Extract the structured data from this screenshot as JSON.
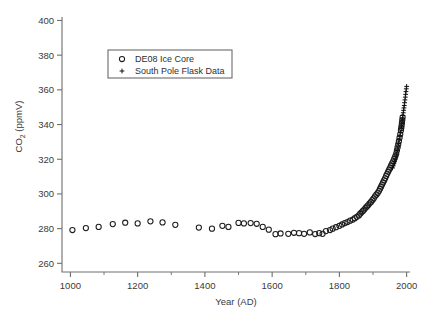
{
  "chart_data": {
    "type": "scatter",
    "title": "",
    "xlabel": "Year (AD)",
    "ylabel": "CO2 (ppmV)",
    "ylabel_base": "CO",
    "ylabel_sub": "2",
    "ylabel_unit": " (ppmV)",
    "xlim": [
      975,
      2010
    ],
    "ylim": [
      255,
      402
    ],
    "xticks": [
      1000,
      1200,
      1400,
      1600,
      1800,
      2000
    ],
    "xticklabels": [
      "1000",
      "1200",
      "1400",
      "1600",
      "1800",
      "2000"
    ],
    "xminorticks": [
      1100,
      1300,
      1500,
      1700,
      1900
    ],
    "yticks": [
      260,
      280,
      300,
      320,
      340,
      360,
      380,
      400
    ],
    "yticklabels": [
      "260",
      "280",
      "300",
      "320",
      "340",
      "360",
      "380",
      "400"
    ],
    "grid": false,
    "legend_position": "upper-left-inset",
    "legend": [
      {
        "label": "DE08 Ice Core",
        "marker": "circle"
      },
      {
        "label": "South Pole Flask Data",
        "marker": "plus"
      }
    ],
    "series": [
      {
        "name": "DE08 Ice Core",
        "marker": "circle",
        "points": [
          [
            1006,
            279.2
          ],
          [
            1046,
            280.3
          ],
          [
            1084,
            281.0
          ],
          [
            1126,
            282.6
          ],
          [
            1163,
            283.4
          ],
          [
            1200,
            283.0
          ],
          [
            1238,
            284.2
          ],
          [
            1274,
            283.6
          ],
          [
            1312,
            282.2
          ],
          [
            1382,
            280.6
          ],
          [
            1421,
            280.0
          ],
          [
            1452,
            281.6
          ],
          [
            1470,
            281.0
          ],
          [
            1500,
            283.3
          ],
          [
            1516,
            283.0
          ],
          [
            1536,
            283.2
          ],
          [
            1554,
            282.8
          ],
          [
            1572,
            281.0
          ],
          [
            1590,
            279.4
          ],
          [
            1610,
            276.8
          ],
          [
            1625,
            277.2
          ],
          [
            1648,
            277.0
          ],
          [
            1665,
            277.6
          ],
          [
            1680,
            277.4
          ],
          [
            1695,
            277.0
          ],
          [
            1712,
            277.8
          ],
          [
            1728,
            276.9
          ],
          [
            1740,
            277.4
          ],
          [
            1750,
            277.0
          ],
          [
            1760,
            278.6
          ],
          [
            1772,
            279.2
          ],
          [
            1780,
            280.0
          ],
          [
            1790,
            280.8
          ],
          [
            1800,
            281.6
          ],
          [
            1808,
            282.4
          ],
          [
            1816,
            283.2
          ],
          [
            1824,
            283.8
          ],
          [
            1832,
            284.6
          ],
          [
            1840,
            285.2
          ],
          [
            1846,
            286.0
          ],
          [
            1852,
            286.8
          ],
          [
            1858,
            287.6
          ],
          [
            1862,
            288.6
          ],
          [
            1866,
            289.4
          ],
          [
            1870,
            290.2
          ],
          [
            1874,
            291.0
          ],
          [
            1878,
            292.0
          ],
          [
            1882,
            292.8
          ],
          [
            1886,
            293.6
          ],
          [
            1890,
            294.6
          ],
          [
            1894,
            295.4
          ],
          [
            1898,
            296.4
          ],
          [
            1902,
            297.4
          ],
          [
            1906,
            298.6
          ],
          [
            1910,
            299.6
          ],
          [
            1914,
            300.6
          ],
          [
            1918,
            301.8
          ],
          [
            1921,
            303.0
          ],
          [
            1924,
            304.2
          ],
          [
            1927,
            305.4
          ],
          [
            1930,
            306.6
          ],
          [
            1933,
            307.8
          ],
          [
            1936,
            309.0
          ],
          [
            1939,
            310.4
          ],
          [
            1942,
            311.6
          ],
          [
            1945,
            312.8
          ],
          [
            1948,
            314.0
          ],
          [
            1951,
            315.2
          ],
          [
            1954,
            316.4
          ],
          [
            1957,
            317.6
          ],
          [
            1960,
            318.8
          ],
          [
            1963,
            320.2
          ],
          [
            1966,
            321.6
          ],
          [
            1969,
            323.2
          ],
          [
            1971,
            325.0
          ],
          [
            1973,
            326.8
          ],
          [
            1975,
            328.6
          ],
          [
            1977,
            330.4
          ],
          [
            1979,
            332.4
          ],
          [
            1981,
            334.4
          ],
          [
            1983,
            336.6
          ],
          [
            1984,
            338.0
          ],
          [
            1985,
            339.4
          ],
          [
            1986,
            341.0
          ],
          [
            1987,
            342.6
          ],
          [
            1988,
            344.2
          ]
        ]
      },
      {
        "name": "South Pole Flask Data",
        "marker": "plus",
        "points": [
          [
            1958,
            315.0
          ],
          [
            1960,
            316.2
          ],
          [
            1962,
            317.4
          ],
          [
            1964,
            318.6
          ],
          [
            1966,
            320.0
          ],
          [
            1968,
            321.4
          ],
          [
            1970,
            323.0
          ],
          [
            1972,
            325.0
          ],
          [
            1974,
            327.0
          ],
          [
            1976,
            329.0
          ],
          [
            1978,
            331.2
          ],
          [
            1980,
            333.4
          ],
          [
            1982,
            335.4
          ],
          [
            1984,
            337.6
          ],
          [
            1985,
            339.0
          ],
          [
            1986,
            340.4
          ],
          [
            1987,
            342.0
          ],
          [
            1988,
            343.6
          ],
          [
            1989,
            345.2
          ],
          [
            1990,
            346.8
          ],
          [
            1991,
            348.2
          ],
          [
            1992,
            349.6
          ],
          [
            1993,
            351.0
          ],
          [
            1994,
            352.6
          ],
          [
            1995,
            354.2
          ],
          [
            1996,
            355.8
          ],
          [
            1997,
            357.4
          ],
          [
            1998,
            359.0
          ],
          [
            1999,
            360.6
          ],
          [
            2000,
            362.0
          ]
        ]
      }
    ]
  }
}
